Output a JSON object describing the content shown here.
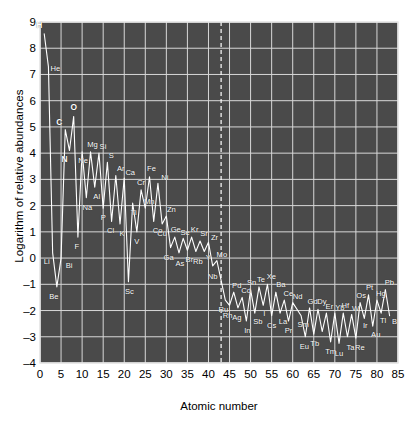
{
  "chart_data": {
    "type": "line",
    "title": "",
    "xlabel": "Atomic number",
    "ylabel": "Logarithm of relative abundances",
    "xlim": [
      0,
      85
    ],
    "ylim": [
      -4,
      9
    ],
    "xticks": [
      0,
      5,
      10,
      15,
      20,
      25,
      30,
      35,
      40,
      45,
      50,
      55,
      60,
      65,
      70,
      75,
      80,
      85
    ],
    "yticks": [
      -4,
      -3,
      -2,
      -1,
      0,
      1,
      2,
      3,
      4,
      5,
      6,
      7,
      8,
      9
    ],
    "ytick_labels": [
      "–4",
      "–3",
      "–2",
      "–1",
      "0",
      "1",
      "2",
      "3",
      "4",
      "5",
      "6",
      "7",
      "8",
      "9"
    ],
    "grid": true,
    "plot_background": "#4a4a4a",
    "line_color": "#ffffff",
    "grid_color": "#d8d8d8",
    "gap_marker": {
      "x": 43,
      "style": "dashed",
      "note": "technetium gap"
    },
    "x": [
      1,
      2,
      3,
      4,
      5,
      6,
      7,
      8,
      9,
      10,
      11,
      12,
      13,
      14,
      15,
      16,
      17,
      18,
      19,
      20,
      21,
      22,
      23,
      24,
      25,
      26,
      27,
      28,
      29,
      30,
      31,
      32,
      33,
      34,
      35,
      36,
      37,
      38,
      39,
      40,
      41,
      42,
      44,
      45,
      46,
      47,
      48,
      49,
      50,
      51,
      52,
      53,
      54,
      55,
      56,
      57,
      58,
      59,
      60,
      62,
      63,
      64,
      65,
      66,
      67,
      68,
      69,
      70,
      71,
      72,
      73,
      74,
      75,
      76,
      77,
      78,
      79,
      80,
      81,
      82,
      83
    ],
    "y": [
      8.55,
      7.3,
      0.2,
      -1.1,
      0.0,
      4.9,
      4.1,
      5.4,
      0.8,
      4.05,
      2.3,
      4.05,
      2.7,
      4.0,
      1.9,
      3.65,
      1.4,
      3.15,
      1.3,
      3.05,
      -0.9,
      2.1,
      1.0,
      2.6,
      1.9,
      3.1,
      1.4,
      2.85,
      1.3,
      1.6,
      0.4,
      0.8,
      0.2,
      0.75,
      0.3,
      0.8,
      0.25,
      0.65,
      0.25,
      0.6,
      -0.3,
      -0.1,
      -1.6,
      -1.8,
      -1.3,
      -1.9,
      -1.5,
      -2.4,
      -1.2,
      -2.1,
      -1.1,
      -1.8,
      -1.0,
      -2.2,
      -1.3,
      -2.1,
      -1.6,
      -2.4,
      -1.7,
      -2.2,
      -3.0,
      -1.9,
      -2.9,
      -1.95,
      -2.8,
      -2.1,
      -3.2,
      -2.1,
      -3.25,
      -2.1,
      -3.0,
      -2.15,
      -3.05,
      -1.7,
      -2.3,
      -1.4,
      -2.6,
      -1.6,
      -2.1,
      -1.2,
      -2.2
    ],
    "point_labels": [
      {
        "symbol": "H",
        "x": 1,
        "y": 8.55,
        "bold": true,
        "dx": -5,
        "dy": -9
      },
      {
        "symbol": "He",
        "x": 2,
        "y": 7.3,
        "bold": false,
        "dx": 7,
        "dy": 1
      },
      {
        "symbol": "Li",
        "x": 3,
        "y": 0.2,
        "bold": false,
        "dx": -6,
        "dy": 8
      },
      {
        "symbol": "Be",
        "x": 4,
        "y": -1.1,
        "bold": false,
        "dx": -3,
        "dy": 9
      },
      {
        "symbol": "Bi",
        "x": 5,
        "y": 0.0,
        "bold": false,
        "dx": 8,
        "dy": 7
      },
      {
        "symbol": "C",
        "x": 6,
        "y": 4.9,
        "bold": true,
        "dx": -6,
        "dy": -8
      },
      {
        "symbol": "N",
        "x": 7,
        "y": 4.1,
        "bold": true,
        "dx": -5,
        "dy": 8
      },
      {
        "symbol": "O",
        "x": 8,
        "y": 5.4,
        "bold": true,
        "dx": 0,
        "dy": -9
      },
      {
        "symbol": "F",
        "x": 9,
        "y": 0.8,
        "bold": false,
        "dx": -1,
        "dy": 9
      },
      {
        "symbol": "Ne",
        "x": 10,
        "y": 4.05,
        "bold": false,
        "dx": 1,
        "dy": 8
      },
      {
        "symbol": "Na",
        "x": 11,
        "y": 2.3,
        "bold": false,
        "dx": 1,
        "dy": 9
      },
      {
        "symbol": "Mg",
        "x": 12,
        "y": 4.05,
        "bold": false,
        "dx": 2,
        "dy": -8
      },
      {
        "symbol": "Al",
        "x": 13,
        "y": 2.7,
        "bold": false,
        "dx": 2,
        "dy": 9
      },
      {
        "symbol": "Si",
        "x": 14,
        "y": 4.0,
        "bold": false,
        "dx": 4,
        "dy": -7
      },
      {
        "symbol": "P",
        "x": 15,
        "y": 1.9,
        "bold": false,
        "dx": 0,
        "dy": 9
      },
      {
        "symbol": "S",
        "x": 16,
        "y": 3.65,
        "bold": false,
        "dx": 4,
        "dy": -7
      },
      {
        "symbol": "Cl",
        "x": 17,
        "y": 1.4,
        "bold": false,
        "dx": -1,
        "dy": 9
      },
      {
        "symbol": "Ar",
        "x": 18,
        "y": 3.15,
        "bold": false,
        "dx": 5,
        "dy": -7
      },
      {
        "symbol": "K",
        "x": 19,
        "y": 1.3,
        "bold": false,
        "dx": 2,
        "dy": 9
      },
      {
        "symbol": "Ca",
        "x": 20,
        "y": 3.05,
        "bold": false,
        "dx": 6,
        "dy": -6
      },
      {
        "symbol": "Sc",
        "x": 21,
        "y": -0.9,
        "bold": false,
        "dx": 1,
        "dy": 9
      },
      {
        "symbol": "Ti",
        "x": 22,
        "y": 2.1,
        "bold": false,
        "dx": 1,
        "dy": 9
      },
      {
        "symbol": "V",
        "x": 23,
        "y": 1.0,
        "bold": false,
        "dx": 0,
        "dy": 9
      },
      {
        "symbol": "Cr",
        "x": 24,
        "y": 2.6,
        "bold": false,
        "dx": 0,
        "dy": -8
      },
      {
        "symbol": "Mn",
        "x": 25,
        "y": 1.9,
        "bold": false,
        "dx": 4,
        "dy": -7
      },
      {
        "symbol": "Fe",
        "x": 26,
        "y": 3.1,
        "bold": false,
        "dx": 2,
        "dy": -9
      },
      {
        "symbol": "Co",
        "x": 27,
        "y": 1.4,
        "bold": false,
        "dx": 4,
        "dy": 9
      },
      {
        "symbol": "Ni",
        "x": 28,
        "y": 2.85,
        "bold": false,
        "dx": 7,
        "dy": -6
      },
      {
        "symbol": "Cu",
        "x": 29,
        "y": 1.3,
        "bold": false,
        "dx": 0,
        "dy": 9
      },
      {
        "symbol": "Zn",
        "x": 30,
        "y": 1.6,
        "bold": false,
        "dx": 5,
        "dy": -7
      },
      {
        "symbol": "Ga",
        "x": 31,
        "y": 0.4,
        "bold": false,
        "dx": -2,
        "dy": 9
      },
      {
        "symbol": "Ge",
        "x": 32,
        "y": 0.8,
        "bold": false,
        "dx": 1,
        "dy": -8
      },
      {
        "symbol": "As",
        "x": 33,
        "y": 0.2,
        "bold": false,
        "dx": 1,
        "dy": 10
      },
      {
        "symbol": "Se",
        "x": 34,
        "y": 0.75,
        "bold": false,
        "dx": 2,
        "dy": -6
      },
      {
        "symbol": "Br",
        "x": 35,
        "y": 0.3,
        "bold": false,
        "dx": 2,
        "dy": 9
      },
      {
        "symbol": "Kr",
        "x": 36,
        "y": 0.8,
        "bold": false,
        "dx": 3,
        "dy": -8
      },
      {
        "symbol": "Rb",
        "x": 37,
        "y": 0.25,
        "bold": false,
        "dx": 2,
        "dy": 9
      },
      {
        "symbol": "Sr",
        "x": 38,
        "y": 0.65,
        "bold": false,
        "dx": 4,
        "dy": -8
      },
      {
        "symbol": "Y",
        "x": 39,
        "y": 0.25,
        "bold": false,
        "dx": 4,
        "dy": 5
      },
      {
        "symbol": "Zr",
        "x": 40,
        "y": 0.6,
        "bold": false,
        "dx": 6,
        "dy": -5
      },
      {
        "symbol": "Nb",
        "x": 41,
        "y": -0.3,
        "bold": false,
        "dx": 0,
        "dy": 10
      },
      {
        "symbol": "Mo",
        "x": 42,
        "y": -0.1,
        "bold": false,
        "dx": 5,
        "dy": -7
      },
      {
        "symbol": "Ru",
        "x": 44,
        "y": -1.6,
        "bold": false,
        "dx": -2,
        "dy": 9
      },
      {
        "symbol": "Rh",
        "x": 45,
        "y": -1.8,
        "bold": false,
        "dx": -2,
        "dy": 10
      },
      {
        "symbol": "Pd",
        "x": 46,
        "y": -1.3,
        "bold": false,
        "dx": 3,
        "dy": -7
      },
      {
        "symbol": "Ag",
        "x": 47,
        "y": -1.9,
        "bold": false,
        "dx": -1,
        "dy": 9
      },
      {
        "symbol": "Cd",
        "x": 48,
        "y": -1.5,
        "bold": false,
        "dx": 4,
        "dy": -7
      },
      {
        "symbol": "In",
        "x": 49,
        "y": -2.4,
        "bold": false,
        "dx": 1,
        "dy": 9
      },
      {
        "symbol": "Sn",
        "x": 50,
        "y": -1.2,
        "bold": false,
        "dx": 1,
        "dy": -8
      },
      {
        "symbol": "Sb",
        "x": 51,
        "y": -2.1,
        "bold": false,
        "dx": 3,
        "dy": 8
      },
      {
        "symbol": "Te",
        "x": 52,
        "y": -1.1,
        "bold": false,
        "dx": 2,
        "dy": -8
      },
      {
        "symbol": "I",
        "x": 53,
        "y": -1.8,
        "bold": false,
        "dx": 1,
        "dy": 8
      },
      {
        "symbol": "Xe",
        "x": 54,
        "y": -1.0,
        "bold": false,
        "dx": 4,
        "dy": -8
      },
      {
        "symbol": "Cs",
        "x": 55,
        "y": -2.2,
        "bold": false,
        "dx": 0,
        "dy": 9
      },
      {
        "symbol": "Ba",
        "x": 56,
        "y": -1.3,
        "bold": false,
        "dx": 5,
        "dy": -8
      },
      {
        "symbol": "La",
        "x": 57,
        "y": -2.1,
        "bold": false,
        "dx": 3,
        "dy": 8
      },
      {
        "symbol": "Ce",
        "x": 58,
        "y": -1.6,
        "bold": false,
        "dx": 4,
        "dy": -7
      },
      {
        "symbol": "Pr",
        "x": 59,
        "y": -2.4,
        "bold": false,
        "dx": 0,
        "dy": 9
      },
      {
        "symbol": "Nd",
        "x": 60,
        "y": -1.7,
        "bold": false,
        "dx": 5,
        "dy": -7
      },
      {
        "symbol": "Sm",
        "x": 62,
        "y": -2.2,
        "bold": false,
        "dx": 2,
        "dy": 8
      },
      {
        "symbol": "Eu",
        "x": 63,
        "y": -3.0,
        "bold": false,
        "dx": -1,
        "dy": 9
      },
      {
        "symbol": "Gd",
        "x": 64,
        "y": -1.9,
        "bold": false,
        "dx": 3,
        "dy": -7
      },
      {
        "symbol": "Tb",
        "x": 65,
        "y": -2.9,
        "bold": false,
        "dx": 1,
        "dy": 9
      },
      {
        "symbol": "Dy",
        "x": 66,
        "y": -1.95,
        "bold": false,
        "dx": 4,
        "dy": -8
      },
      {
        "symbol": "Tm",
        "x": 69,
        "y": -3.2,
        "bold": false,
        "dx": 0,
        "dy": 9
      },
      {
        "symbol": "Er",
        "x": 68,
        "y": -2.1,
        "bold": false,
        "dx": 3,
        "dy": -7
      },
      {
        "symbol": "Yb",
        "x": 70,
        "y": -2.1,
        "bold": false,
        "dx": 5,
        "dy": -6
      },
      {
        "symbol": "Lu",
        "x": 71,
        "y": -3.25,
        "bold": false,
        "dx": 0,
        "dy": 10
      },
      {
        "symbol": "Hf",
        "x": 72,
        "y": -2.1,
        "bold": false,
        "dx": 2,
        "dy": -8
      },
      {
        "symbol": "Ta",
        "x": 73,
        "y": -3.0,
        "bold": false,
        "dx": 3,
        "dy": 10
      },
      {
        "symbol": "W",
        "x": 74,
        "y": -2.15,
        "bold": false,
        "dx": 4,
        "dy": -6
      },
      {
        "symbol": "Re",
        "x": 75,
        "y": -3.05,
        "bold": false,
        "dx": 4,
        "dy": 9
      },
      {
        "symbol": "Os",
        "x": 76,
        "y": -1.7,
        "bold": false,
        "dx": 1,
        "dy": -8
      },
      {
        "symbol": "Ir",
        "x": 77,
        "y": -2.3,
        "bold": false,
        "dx": 1,
        "dy": 7
      },
      {
        "symbol": "Pt",
        "x": 78,
        "y": -1.4,
        "bold": false,
        "dx": 1,
        "dy": -8
      },
      {
        "symbol": "Au",
        "x": 79,
        "y": -2.6,
        "bold": false,
        "dx": 3,
        "dy": 8
      },
      {
        "symbol": "Hg",
        "x": 80,
        "y": -1.6,
        "bold": false,
        "dx": 4,
        "dy": -7
      },
      {
        "symbol": "Tl",
        "x": 81,
        "y": -2.1,
        "bold": false,
        "dx": 2,
        "dy": 7
      },
      {
        "symbol": "Pb",
        "x": 82,
        "y": -1.2,
        "bold": false,
        "dx": 4,
        "dy": -8
      },
      {
        "symbol": "B",
        "x": 83,
        "y": -2.2,
        "bold": false,
        "dx": 5,
        "dy": 5
      }
    ]
  }
}
